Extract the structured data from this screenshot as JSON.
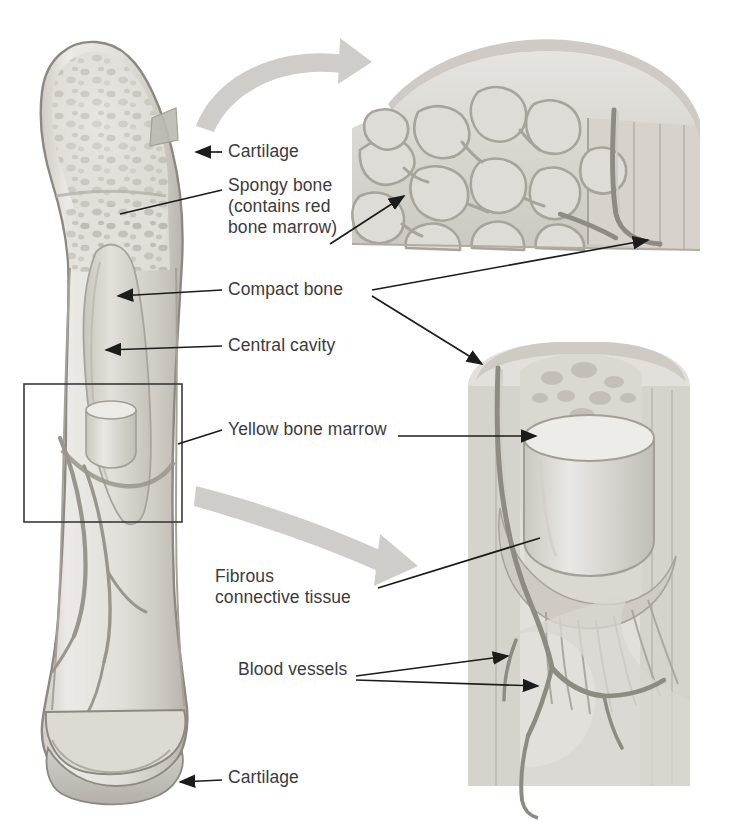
{
  "figure": {
    "kind": "anatomical-illustration",
    "style": "grayscale pencil/airbrush medical illustration",
    "background_color": "#ffffff"
  },
  "palette": {
    "background": "#ffffff",
    "bone_light": "#e8e6e2",
    "bone_mid": "#d5d2cc",
    "bone_shadow": "#b9b5ae",
    "cortex_outline": "#8d8880",
    "cartilage": "#c9c6c0",
    "marrow_cavity": "#ddd9d3",
    "vessel": "#9a958d",
    "leader_line": "#1c1c1c",
    "label_text": "#3b3b3b",
    "callout_box": "#3a3a3a",
    "curved_arrow": "#cfcdc9"
  },
  "labels": [
    {
      "id": "cartilage-top",
      "text": "Cartilage",
      "x": 228,
      "y": 152,
      "align": "left",
      "leader": "arrow-left-to-proximal-epiphysis"
    },
    {
      "id": "spongy-bone",
      "text": "Spongy bone\n(contains red\nbone marrow)",
      "x": 228,
      "y": 186,
      "align": "left",
      "leader": "line-left-to-epiphysis and arrow-right-to-inset"
    },
    {
      "id": "compact-bone",
      "text": "Compact bone",
      "x": 228,
      "y": 290,
      "align": "left",
      "leader": "arrow-left-to-cortex and two-arrows-right-to-insets"
    },
    {
      "id": "central-cavity",
      "text": "Central cavity",
      "x": 228,
      "y": 345,
      "align": "left",
      "leader": "arrow-left-to-medullary-cavity"
    },
    {
      "id": "yellow-bone-marrow",
      "text": "Yellow bone marrow",
      "x": 228,
      "y": 428,
      "align": "left",
      "leader": "line-left-to-callout-box and arrow-right-to-lower-inset"
    },
    {
      "id": "fibrous-connective-tissue",
      "text": "Fibrous\nconnective tissue",
      "x": 215,
      "y": 578,
      "align": "left",
      "leader": "line-right-to-lower-inset"
    },
    {
      "id": "blood-vessels",
      "text": "Blood vessels",
      "x": 238,
      "y": 670,
      "align": "left",
      "leader": "two-arrows-right-to-vessels"
    },
    {
      "id": "cartilage-bottom",
      "text": "Cartilage",
      "x": 228,
      "y": 778,
      "align": "left",
      "leader": "arrow-left-to-distal-epiphysis"
    }
  ],
  "parts": {
    "whole_bone": "femur longitudinal section, left side of figure",
    "proximal_epiphysis": "rounded head with trabecular spongy bone and wedge cutaway",
    "diaphysis": "shaft with compact bone cortex and central medullary cavity",
    "distal_epiphysis": "condyles with darker cartilage cap",
    "callout_box": "rectangle on mid-shaft marking the region magnified below",
    "inset_top": "magnified spongy bone lattice meeting compact bone with vessel",
    "inset_lower": "magnified marrow plug, fibrous connective tissue and blood vessels"
  },
  "curved_arrows": [
    {
      "id": "arrow-to-top-inset",
      "direction": "up-right",
      "from": "proximal epiphysis cutaway",
      "to": "top inset"
    },
    {
      "id": "arrow-to-lower-inset",
      "direction": "down-right",
      "from": "shaft callout box",
      "to": "lower inset"
    }
  ]
}
